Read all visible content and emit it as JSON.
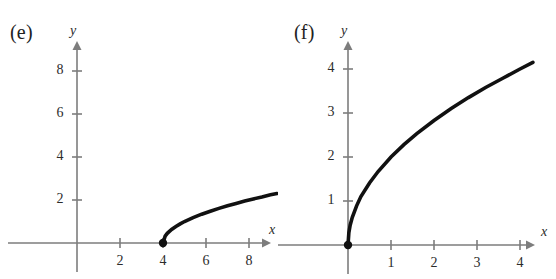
{
  "figure": {
    "background_color": "#ffffff",
    "axis_color": "#7d7d7d",
    "curve_color": "#111111",
    "text_color": "#2b2b2b"
  },
  "panels": [
    {
      "label": "(e)",
      "x_axis_name": "x",
      "y_axis_name": "y",
      "x_ticks": [
        "2",
        "4",
        "6",
        "8"
      ],
      "y_ticks": [
        "2",
        "4",
        "6",
        "8"
      ]
    },
    {
      "label": "(f)",
      "x_axis_name": "x",
      "y_axis_name": "y",
      "x_ticks": [
        "1",
        "2",
        "3",
        "4"
      ],
      "y_ticks": [
        "1",
        "2",
        "3",
        "4"
      ]
    }
  ],
  "chart_data": [
    {
      "type": "line",
      "title": "(e)",
      "xlabel": "x",
      "ylabel": "y",
      "xlim": [
        -0.8,
        9.8
      ],
      "ylim": [
        -0.9,
        9.6
      ],
      "xticks": [
        2,
        4,
        6,
        8
      ],
      "yticks": [
        2,
        4,
        6,
        8
      ],
      "grid": false,
      "legend": "none",
      "series": [
        {
          "name": "y = sqrt(x - 4)",
          "x": [
            4.0,
            4.1,
            4.2,
            4.4,
            4.6,
            4.8,
            5.0,
            5.4,
            5.8,
            6.2,
            6.6,
            7.0,
            7.4,
            7.8,
            8.2,
            8.6,
            9.0,
            9.3
          ],
          "y": [
            0.0,
            0.32,
            0.45,
            0.63,
            0.77,
            0.89,
            1.0,
            1.18,
            1.34,
            1.48,
            1.61,
            1.73,
            1.84,
            1.95,
            2.05,
            2.14,
            2.24,
            2.3
          ]
        }
      ],
      "markers": [
        {
          "type": "filled-dot",
          "x": 4,
          "y": 0
        }
      ]
    },
    {
      "type": "line",
      "title": "(f)",
      "xlabel": "x",
      "ylabel": "y",
      "xlim": [
        -0.45,
        4.9
      ],
      "ylim": [
        -0.5,
        4.9
      ],
      "xticks": [
        1,
        2,
        3,
        4
      ],
      "yticks": [
        1,
        2,
        3,
        4
      ],
      "grid": false,
      "legend": "none",
      "series": [
        {
          "name": "y = 2*sqrt(x)",
          "x": [
            0.0,
            0.02,
            0.05,
            0.1,
            0.2,
            0.3,
            0.5,
            0.7,
            1.0,
            1.3,
            1.6,
            2.0,
            2.4,
            2.8,
            3.2,
            3.6,
            4.0,
            4.3
          ],
          "y": [
            0.0,
            0.28,
            0.45,
            0.63,
            0.89,
            1.1,
            1.41,
            1.67,
            2.0,
            2.28,
            2.53,
            2.83,
            3.1,
            3.35,
            3.58,
            3.79,
            4.0,
            4.15
          ]
        }
      ],
      "markers": [
        {
          "type": "filled-dot",
          "x": 0,
          "y": 0
        }
      ]
    }
  ]
}
